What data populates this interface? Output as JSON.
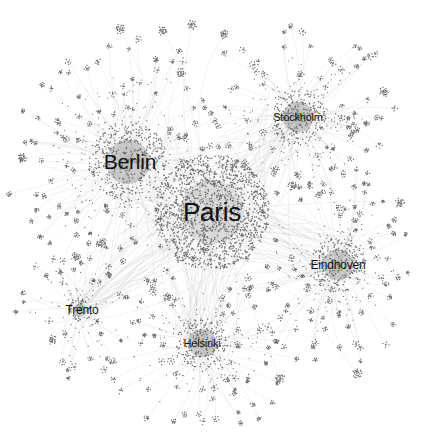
{
  "graph": {
    "width": 422,
    "height": 438,
    "background": "#ffffff",
    "node_color": "#555555",
    "edge_color": "#bdbdbd",
    "hubs": [
      {
        "id": "paris",
        "label": "Paris",
        "x": 212,
        "y": 212,
        "radius": 58,
        "fringe": 0,
        "dense": 1400,
        "font_size": 26,
        "label_dx": 0,
        "label_dy": 0
      },
      {
        "id": "berlin",
        "label": "Berlin",
        "x": 128,
        "y": 162,
        "radius": 40,
        "fringe": 105,
        "dense": 380,
        "font_size": 21,
        "label_dx": 2,
        "label_dy": 0
      },
      {
        "id": "stockholm",
        "label": "Stockholm",
        "x": 298,
        "y": 117,
        "radius": 28,
        "fringe": 78,
        "dense": 220,
        "font_size": 11,
        "label_dx": 0,
        "label_dy": 0
      },
      {
        "id": "eindhoven",
        "label": "Eindhoven",
        "x": 338,
        "y": 265,
        "radius": 28,
        "fringe": 75,
        "dense": 230,
        "font_size": 12,
        "label_dx": 0,
        "label_dy": 0
      },
      {
        "id": "helsinki",
        "label": "Helsinki",
        "x": 202,
        "y": 343,
        "radius": 26,
        "fringe": 70,
        "dense": 200,
        "font_size": 11,
        "label_dx": 0,
        "label_dy": 0
      },
      {
        "id": "trento",
        "label": "Trento",
        "x": 80,
        "y": 310,
        "radius": 12,
        "fringe": 32,
        "dense": 60,
        "font_size": 12,
        "label_dx": 2,
        "label_dy": 0
      }
    ],
    "satellites": [
      {
        "x": 192,
        "y": 25
      },
      {
        "x": 224,
        "y": 34
      },
      {
        "x": 163,
        "y": 31
      },
      {
        "x": 120,
        "y": 29
      },
      {
        "x": 168,
        "y": 297
      },
      {
        "x": 280,
        "y": 378
      },
      {
        "x": 357,
        "y": 373
      },
      {
        "x": 76,
        "y": 257
      },
      {
        "x": 102,
        "y": 243
      },
      {
        "x": 293,
        "y": 186
      },
      {
        "x": 181,
        "y": 73
      },
      {
        "x": 22,
        "y": 158
      },
      {
        "x": 384,
        "y": 92
      },
      {
        "x": 400,
        "y": 203
      },
      {
        "x": 52,
        "y": 340
      }
    ]
  }
}
